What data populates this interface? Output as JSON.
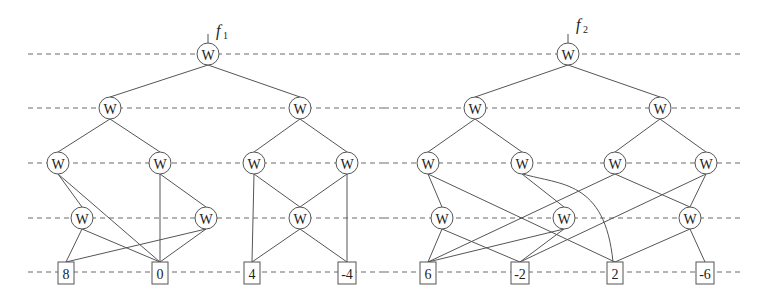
{
  "diagram": {
    "rows_y": [
      54,
      108,
      163,
      218,
      272
    ],
    "dashes": [
      {
        "x1": 28,
        "x2": 384,
        "y": 54
      },
      {
        "x1": 384,
        "x2": 743,
        "y": 54
      },
      {
        "x1": 28,
        "x2": 384,
        "y": 108
      },
      {
        "x1": 384,
        "x2": 743,
        "y": 108
      },
      {
        "x1": 28,
        "x2": 384,
        "y": 163
      },
      {
        "x1": 384,
        "x2": 743,
        "y": 163
      },
      {
        "x1": 28,
        "x2": 384,
        "y": 218
      },
      {
        "x1": 384,
        "x2": 743,
        "y": 218
      },
      {
        "x1": 28,
        "x2": 384,
        "y": 272
      },
      {
        "x1": 384,
        "x2": 743,
        "y": 272
      }
    ],
    "trees": [
      {
        "output_label": "f",
        "output_subscript": "1",
        "label_pos": {
          "x": 216,
          "y": 36
        },
        "nodes": [
          {
            "id": "a0",
            "type": "W",
            "label": "W",
            "x": 208,
            "y": 54
          },
          {
            "id": "a1",
            "type": "W",
            "label": "W",
            "x": 110,
            "y": 108
          },
          {
            "id": "a2",
            "type": "W",
            "label": "W",
            "x": 300,
            "y": 108
          },
          {
            "id": "a3",
            "type": "W",
            "label": "W",
            "x": 58,
            "y": 163
          },
          {
            "id": "a4",
            "type": "W",
            "label": "W",
            "x": 160,
            "y": 163
          },
          {
            "id": "a5",
            "type": "W",
            "label": "W",
            "x": 254,
            "y": 163
          },
          {
            "id": "a6",
            "type": "W",
            "label": "W",
            "x": 347,
            "y": 163
          },
          {
            "id": "a7",
            "type": "W",
            "label": "W",
            "x": 82,
            "y": 218
          },
          {
            "id": "a8",
            "type": "W",
            "label": "W",
            "x": 206,
            "y": 218
          },
          {
            "id": "a9",
            "type": "W",
            "label": "W",
            "x": 300,
            "y": 218
          },
          {
            "id": "l1",
            "type": "leaf",
            "label": "8",
            "x": 66,
            "y": 273
          },
          {
            "id": "l2",
            "type": "leaf",
            "label": "0",
            "x": 160,
            "y": 273
          },
          {
            "id": "l3",
            "type": "leaf",
            "label": "4",
            "x": 252,
            "y": 273
          },
          {
            "id": "l4",
            "type": "leaf",
            "label": "-4",
            "x": 347,
            "y": 273
          }
        ],
        "edges": [
          [
            "a0",
            "a1"
          ],
          [
            "a0",
            "a2"
          ],
          [
            "a1",
            "a3"
          ],
          [
            "a1",
            "a4"
          ],
          [
            "a2",
            "a5"
          ],
          [
            "a2",
            "a6"
          ],
          [
            "a3",
            "a7"
          ],
          [
            "a3",
            "l2"
          ],
          [
            "a4",
            "l2"
          ],
          [
            "a4",
            "a8"
          ],
          [
            "a7",
            "l1"
          ],
          [
            "a7",
            "l2"
          ],
          [
            "a8",
            "l1"
          ],
          [
            "a8",
            "l2"
          ],
          [
            "a5",
            "l3"
          ],
          [
            "a5",
            "a9"
          ],
          [
            "a6",
            "a9"
          ],
          [
            "a6",
            "l4"
          ],
          [
            "a9",
            "l3"
          ],
          [
            "a9",
            "l4"
          ]
        ]
      },
      {
        "output_label": "f",
        "output_subscript": "2",
        "label_pos": {
          "x": 576,
          "y": 30
        },
        "nodes": [
          {
            "id": "b0",
            "type": "W",
            "label": "W",
            "x": 568,
            "y": 54
          },
          {
            "id": "b1",
            "type": "W",
            "label": "W",
            "x": 475,
            "y": 108
          },
          {
            "id": "b2",
            "type": "W",
            "label": "W",
            "x": 660,
            "y": 108
          },
          {
            "id": "b3",
            "type": "W",
            "label": "W",
            "x": 428,
            "y": 163
          },
          {
            "id": "b4",
            "type": "W",
            "label": "W",
            "x": 522,
            "y": 163
          },
          {
            "id": "b5",
            "type": "W",
            "label": "W",
            "x": 615,
            "y": 163
          },
          {
            "id": "b6",
            "type": "W",
            "label": "W",
            "x": 706,
            "y": 163
          },
          {
            "id": "b7",
            "type": "W",
            "label": "W",
            "x": 442,
            "y": 218
          },
          {
            "id": "b8",
            "type": "W",
            "label": "W",
            "x": 564,
            "y": 218
          },
          {
            "id": "b9",
            "type": "W",
            "label": "W",
            "x": 690,
            "y": 218
          },
          {
            "id": "m1",
            "type": "leaf",
            "label": "6",
            "x": 428,
            "y": 273
          },
          {
            "id": "m2",
            "type": "leaf",
            "label": "-2",
            "x": 520,
            "y": 273
          },
          {
            "id": "m3",
            "type": "leaf",
            "label": "2",
            "x": 615,
            "y": 273
          },
          {
            "id": "m4",
            "type": "leaf",
            "label": "-6",
            "x": 705,
            "y": 273
          }
        ],
        "edges": [
          [
            "b0",
            "b1"
          ],
          [
            "b0",
            "b2"
          ],
          [
            "b1",
            "b3"
          ],
          [
            "b1",
            "b4"
          ],
          [
            "b2",
            "b5"
          ],
          [
            "b2",
            "b6"
          ],
          [
            "b3",
            "b7"
          ],
          [
            "b3",
            "m3"
          ],
          [
            "b4",
            "b8"
          ],
          [
            "b5",
            "m1"
          ],
          [
            "b5",
            "b9"
          ],
          [
            "b6",
            "m2"
          ],
          [
            "b6",
            "b9"
          ],
          [
            "b7",
            "m1"
          ],
          [
            "b7",
            "m2"
          ],
          [
            "b8",
            "m1"
          ],
          [
            "b8",
            "m2"
          ],
          [
            "b9",
            "m3"
          ],
          [
            "b9",
            "m4"
          ]
        ],
        "curves": [
          {
            "from": "b4",
            "to": "m3",
            "path": "M523,174 C560,185 605,180 613,262"
          }
        ]
      }
    ]
  }
}
